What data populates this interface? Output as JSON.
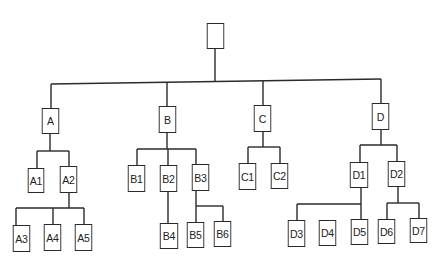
{
  "diagram": {
    "type": "tree",
    "line_color": "#2a2a2a",
    "nodes": [
      {
        "id": "root",
        "label": "",
        "x": 206,
        "y": 23,
        "w": 19,
        "h": 26
      },
      {
        "id": "A",
        "label": "A",
        "x": 41,
        "y": 108,
        "w": 19,
        "h": 26
      },
      {
        "id": "B",
        "label": "B",
        "x": 158,
        "y": 106,
        "w": 19,
        "h": 27
      },
      {
        "id": "C",
        "label": "C",
        "x": 253,
        "y": 105,
        "w": 19,
        "h": 27
      },
      {
        "id": "D",
        "label": "D",
        "x": 371,
        "y": 103,
        "w": 19,
        "h": 27
      },
      {
        "id": "A1",
        "label": "A1",
        "x": 27,
        "y": 168,
        "w": 18,
        "h": 25
      },
      {
        "id": "A2",
        "label": "A2",
        "x": 59,
        "y": 166,
        "w": 19,
        "h": 27
      },
      {
        "id": "A3",
        "label": "A3",
        "x": 12,
        "y": 225,
        "w": 19,
        "h": 27
      },
      {
        "id": "A4",
        "label": "A4",
        "x": 43,
        "y": 224,
        "w": 19,
        "h": 27
      },
      {
        "id": "A5",
        "label": "A5",
        "x": 74,
        "y": 224,
        "w": 19,
        "h": 27
      },
      {
        "id": "B1",
        "label": "B1",
        "x": 127,
        "y": 165,
        "w": 19,
        "h": 27
      },
      {
        "id": "B2",
        "label": "B2",
        "x": 159,
        "y": 165,
        "w": 19,
        "h": 27
      },
      {
        "id": "B3",
        "label": "B3",
        "x": 191,
        "y": 164,
        "w": 19,
        "h": 27
      },
      {
        "id": "B4",
        "label": "B4",
        "x": 159,
        "y": 223,
        "w": 20,
        "h": 26
      },
      {
        "id": "B5",
        "label": "B5",
        "x": 186,
        "y": 222,
        "w": 19,
        "h": 26
      },
      {
        "id": "B6",
        "label": "B6",
        "x": 213,
        "y": 221,
        "w": 19,
        "h": 26
      },
      {
        "id": "C1",
        "label": "C1",
        "x": 238,
        "y": 163,
        "w": 19,
        "h": 27
      },
      {
        "id": "C2",
        "label": "C2",
        "x": 270,
        "y": 163,
        "w": 19,
        "h": 26
      },
      {
        "id": "D1",
        "label": "D1",
        "x": 349,
        "y": 162,
        "w": 20,
        "h": 26
      },
      {
        "id": "D2",
        "label": "D2",
        "x": 387,
        "y": 161,
        "w": 19,
        "h": 26
      },
      {
        "id": "D3",
        "label": "D3",
        "x": 287,
        "y": 220,
        "w": 19,
        "h": 27
      },
      {
        "id": "D4",
        "label": "D4",
        "x": 318,
        "y": 220,
        "w": 19,
        "h": 26
      },
      {
        "id": "D5",
        "label": "D5",
        "x": 350,
        "y": 219,
        "w": 19,
        "h": 26
      },
      {
        "id": "D6",
        "label": "D6",
        "x": 377,
        "y": 219,
        "w": 19,
        "h": 25
      },
      {
        "id": "D7",
        "label": "D7",
        "x": 409,
        "y": 218,
        "w": 19,
        "h": 25
      }
    ],
    "edges": [
      {
        "from": "root",
        "to": [
          "A",
          "B",
          "C",
          "D"
        ]
      },
      {
        "from": "A",
        "to": [
          "A1",
          "A2"
        ]
      },
      {
        "from": "A2",
        "to": [
          "A3",
          "A4",
          "A5"
        ]
      },
      {
        "from": "B",
        "to": [
          "B1",
          "B2",
          "B3"
        ]
      },
      {
        "from": "B2",
        "to": [
          "B4"
        ]
      },
      {
        "from": "B3",
        "to": [
          "B5",
          "B6"
        ]
      },
      {
        "from": "C",
        "to": [
          "C1",
          "C2"
        ]
      },
      {
        "from": "D",
        "to": [
          "D1",
          "D2"
        ]
      },
      {
        "from": "D1",
        "to": [
          "D3",
          "D5"
        ]
      },
      {
        "from": "D2",
        "to": [
          "D6",
          "D7"
        ]
      }
    ],
    "unconnected_nodes": [
      "D4"
    ],
    "line_segments": [
      [
        215,
        49,
        215,
        82
      ],
      [
        51,
        84,
        381,
        79
      ],
      [
        51,
        84,
        51,
        108
      ],
      [
        167,
        82,
        167,
        106
      ],
      [
        263,
        81,
        263,
        105
      ],
      [
        381,
        79,
        381,
        103
      ],
      [
        50,
        134,
        50,
        151
      ],
      [
        37,
        151,
        69,
        151
      ],
      [
        37,
        151,
        37,
        168
      ],
      [
        69,
        151,
        69,
        166
      ],
      [
        69,
        193,
        69,
        208
      ],
      [
        16,
        208,
        84,
        208
      ],
      [
        16,
        208,
        16,
        225
      ],
      [
        53,
        208,
        53,
        224
      ],
      [
        84,
        208,
        84,
        224
      ],
      [
        167,
        133,
        167,
        149
      ],
      [
        137,
        149,
        196,
        149
      ],
      [
        137,
        149,
        137,
        165
      ],
      [
        168,
        149,
        168,
        165
      ],
      [
        196,
        149,
        196,
        164
      ],
      [
        168,
        192,
        168,
        223
      ],
      [
        196,
        191,
        196,
        222
      ],
      [
        196,
        206,
        223,
        206
      ],
      [
        223,
        206,
        223,
        221
      ],
      [
        263,
        132,
        263,
        147
      ],
      [
        248,
        147,
        280,
        147
      ],
      [
        248,
        147,
        248,
        163
      ],
      [
        280,
        147,
        280,
        163
      ],
      [
        381,
        130,
        381,
        145
      ],
      [
        360,
        145,
        397,
        145
      ],
      [
        360,
        145,
        360,
        162
      ],
      [
        397,
        145,
        397,
        161
      ],
      [
        361,
        188,
        361,
        219
      ],
      [
        297,
        204,
        361,
        204
      ],
      [
        297,
        204,
        297,
        220
      ],
      [
        398,
        187,
        398,
        203
      ],
      [
        387,
        203,
        419,
        203
      ],
      [
        387,
        203,
        387,
        219
      ],
      [
        419,
        203,
        419,
        218
      ]
    ]
  }
}
